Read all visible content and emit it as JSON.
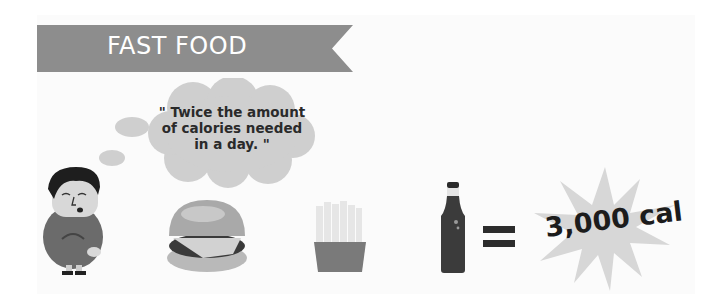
{
  "banner": {
    "title": "FAST FOOD",
    "color": "#8d8d8d"
  },
  "thought_bubble": {
    "text_line1": "\" Twice the amount",
    "text_line2": "of calories needed",
    "text_line3": "in a day. \""
  },
  "items": [
    {
      "name": "person",
      "icon": "sad-man-icon"
    },
    {
      "name": "burger",
      "icon": "burger-icon"
    },
    {
      "name": "fries",
      "icon": "fries-icon"
    },
    {
      "name": "soda",
      "icon": "soda-bottle-icon"
    }
  ],
  "equals": {
    "icon": "equals-icon"
  },
  "result": {
    "label": "3,000 cal",
    "icon": "starburst-icon"
  }
}
